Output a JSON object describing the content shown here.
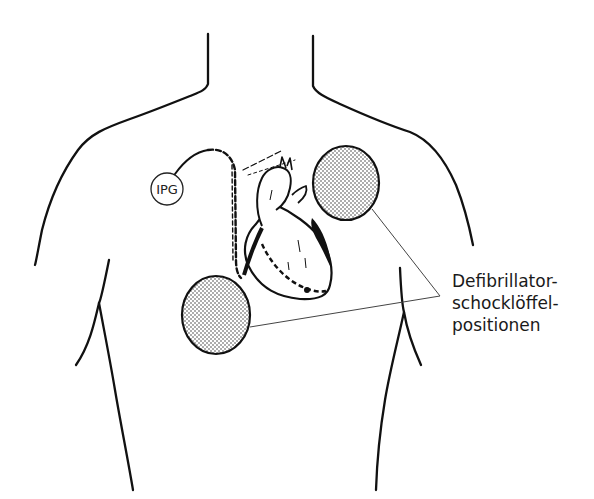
{
  "diagram": {
    "ipg_label": "IPG",
    "callout_lines": [
      "Defibrillator-",
      "schocklöffel-",
      "positionen"
    ],
    "elements": [
      {
        "id": "torso-outline",
        "description": "Upper body / chest outline"
      },
      {
        "id": "heart",
        "description": "Heart with pacemaker lead"
      },
      {
        "id": "pacemaker-lead",
        "description": "Dashed lead from IPG to heart"
      },
      {
        "id": "ipg",
        "description": "Implanted pulse generator circle labeled IPG"
      },
      {
        "id": "paddle-upper-right",
        "description": "Stippled defibrillator paddle, upper right"
      },
      {
        "id": "paddle-lower-left",
        "description": "Stippled defibrillator paddle, lower left"
      }
    ],
    "colors": {
      "line": "#111111",
      "callout_line": "#444444",
      "background": "#ffffff"
    }
  }
}
